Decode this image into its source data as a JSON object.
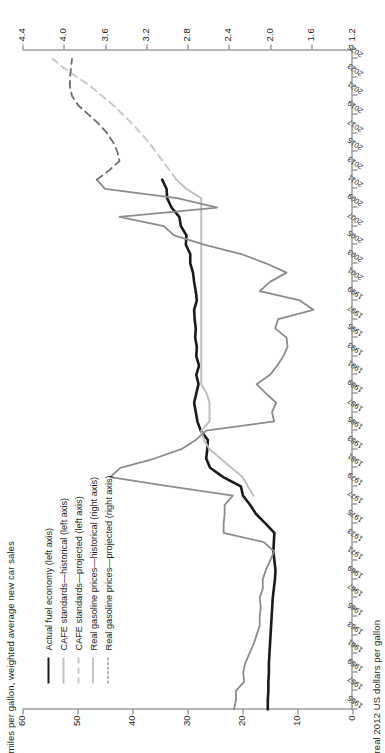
{
  "chart_data": {
    "type": "line",
    "title": "",
    "subtitle": "",
    "xlabel": "",
    "ylabel": "miles per gallon, weighted average new car sales",
    "ylabel_right": "real 2012 US dollars per gallon",
    "xlim": [
      1955,
      2026
    ],
    "ylim": [
      0,
      60
    ],
    "ylim_right": [
      1.2,
      4.4
    ],
    "grid": false,
    "legend_position": "upper-left",
    "yticks": [
      "0",
      "10",
      "20",
      "30",
      "40",
      "50",
      "60"
    ],
    "yticks_right": [
      "1.2",
      "1.6",
      "2.0",
      "2.4",
      "2.8",
      "3.2",
      "3.6",
      "4.0",
      "4.4"
    ],
    "xticks": [
      "1955",
      "1957",
      "1959",
      "1961",
      "1963",
      "1965",
      "1967",
      "1969",
      "1971",
      "1973",
      "1975",
      "1977",
      "1979",
      "1981",
      "1983",
      "1985",
      "1987",
      "1989",
      "1991",
      "1993",
      "1995",
      "1997",
      "1999",
      "2001",
      "2003",
      "2005",
      "2007",
      "2009",
      "2011",
      "2013",
      "2015",
      "2017",
      "2019",
      "2021",
      "2023",
      "2025"
    ],
    "series": [
      {
        "name": "Actual fuel economy (left axis)",
        "axis": "left",
        "style": "solid",
        "color": "#1a1a1a",
        "width": 2.6,
        "x": [
          1955,
          1956,
          1957,
          1958,
          1959,
          1960,
          1961,
          1962,
          1963,
          1964,
          1965,
          1966,
          1967,
          1968,
          1969,
          1970,
          1971,
          1972,
          1973,
          1974,
          1975,
          1976,
          1977,
          1978,
          1979,
          1980,
          1981,
          1982,
          1983,
          1984,
          1985,
          1986,
          1987,
          1988,
          1989,
          1990,
          1991,
          1992,
          1993,
          1994,
          1995,
          1996,
          1997,
          1998,
          1999,
          2000,
          2001,
          2002,
          2003,
          2004,
          2005,
          2006,
          2007,
          2008,
          2009,
          2010,
          2011,
          2012
        ],
        "y": [
          15.4,
          15.4,
          15.3,
          15.3,
          15.2,
          15.2,
          15.1,
          15.0,
          14.9,
          14.8,
          14.7,
          14.6,
          14.5,
          14.3,
          14.1,
          14.0,
          14.2,
          14.4,
          14.3,
          14.2,
          15.8,
          17.5,
          18.6,
          19.9,
          20.3,
          23.5,
          25.9,
          26.6,
          26.4,
          26.3,
          27.6,
          28.2,
          28.5,
          28.8,
          28.4,
          28.0,
          28.4,
          27.9,
          28.4,
          28.3,
          28.6,
          28.5,
          28.7,
          28.8,
          28.3,
          28.5,
          28.8,
          29.0,
          29.5,
          29.5,
          30.3,
          30.2,
          31.2,
          31.5,
          32.9,
          33.7,
          33.8,
          34.6
        ]
      },
      {
        "name": "CAFE standards—historical (left axis)",
        "axis": "left",
        "style": "solid",
        "color": "#bfbfbf",
        "width": 2.0,
        "x": [
          1978,
          1979,
          1980,
          1981,
          1982,
          1983,
          1984,
          1985,
          1986,
          1987,
          1988,
          1989,
          1990,
          1991,
          1992,
          1993,
          1994,
          1995,
          1996,
          1997,
          1998,
          1999,
          2000,
          2001,
          2002,
          2003,
          2004,
          2005,
          2006,
          2007,
          2008,
          2009,
          2010,
          2011,
          2012
        ],
        "y": [
          18.0,
          19.0,
          20.0,
          22.0,
          24.0,
          26.0,
          27.0,
          27.5,
          26.0,
          26.0,
          26.0,
          26.5,
          27.5,
          27.5,
          27.5,
          27.5,
          27.5,
          27.5,
          27.5,
          27.5,
          27.5,
          27.5,
          27.5,
          27.5,
          27.5,
          27.5,
          27.5,
          27.5,
          27.5,
          27.5,
          27.5,
          27.5,
          27.5,
          30.2,
          32.0
        ]
      },
      {
        "name": "CAFE standards—projected (left axis)",
        "axis": "left",
        "style": "dashed",
        "color": "#c9c9c9",
        "width": 2.0,
        "x": [
          2012,
          2014,
          2016,
          2018,
          2020,
          2022,
          2024,
          2025
        ],
        "y": [
          32.0,
          34.5,
          37.0,
          40.0,
          43.5,
          47.5,
          52.5,
          54.5
        ]
      },
      {
        "name": "Real gasoline prices—historical (right axis)",
        "axis": "right",
        "style": "solid",
        "color": "#8c8c8c",
        "width": 1.8,
        "x": [
          1955,
          1956,
          1957,
          1958,
          1959,
          1960,
          1961,
          1962,
          1963,
          1964,
          1965,
          1966,
          1967,
          1968,
          1969,
          1970,
          1971,
          1972,
          1973,
          1974,
          1975,
          1976,
          1977,
          1978,
          1979,
          1980,
          1981,
          1982,
          1983,
          1984,
          1985,
          1986,
          1987,
          1988,
          1989,
          1990,
          1991,
          1992,
          1993,
          1994,
          1995,
          1996,
          1997,
          1998,
          1999,
          2000,
          2001,
          2002,
          2003,
          2004,
          2005,
          2006,
          2007,
          2008,
          2009,
          2010,
          2011,
          2012
        ],
        "y": [
          2.35,
          2.33,
          2.33,
          2.25,
          2.26,
          2.24,
          2.2,
          2.16,
          2.13,
          2.1,
          2.1,
          2.09,
          2.1,
          2.07,
          2.07,
          2.04,
          2.0,
          1.96,
          2.06,
          2.45,
          2.45,
          2.44,
          2.44,
          2.36,
          2.97,
          3.55,
          3.45,
          3.12,
          2.86,
          2.72,
          2.62,
          1.96,
          1.98,
          1.94,
          2.04,
          2.13,
          2.0,
          1.93,
          1.87,
          1.83,
          1.84,
          1.95,
          1.92,
          1.58,
          1.71,
          2.1,
          2.0,
          1.84,
          2.04,
          2.28,
          2.64,
          2.93,
          3.03,
          3.46,
          2.51,
          2.9,
          3.6,
          3.68
        ]
      },
      {
        "name": "Real gasoline prices—projected (right axis)",
        "axis": "right",
        "style": "dashed",
        "color": "#6d6d6d",
        "width": 1.8,
        "x": [
          2012,
          2013,
          2014,
          2015,
          2016,
          2017,
          2018,
          2019,
          2020,
          2021,
          2022,
          2023,
          2024,
          2025
        ],
        "y": [
          3.68,
          3.56,
          3.46,
          3.48,
          3.52,
          3.58,
          3.66,
          3.76,
          3.86,
          3.92,
          3.94,
          3.94,
          3.93,
          3.92
        ]
      }
    ]
  },
  "axes": {
    "left_title": "miles per gallon, weighted average new car sales",
    "right_title": "real 2012 US dollars per gallon"
  },
  "legend": {
    "items": [
      {
        "label": "Actual fuel economy (left axis)",
        "style": "solid",
        "color": "#1a1a1a",
        "width": "2.6"
      },
      {
        "label": "CAFE standards—historical (left axis)",
        "style": "solid",
        "color": "#bfbfbf",
        "width": "2"
      },
      {
        "label": "CAFE standards—projected (left axis)",
        "style": "dashed",
        "color": "#c9c9c9",
        "width": "2"
      },
      {
        "label": "Real gasoline prices—historical (right axis)",
        "style": "solid",
        "color": "#8c8c8c",
        "width": "1.8"
      },
      {
        "label": "Real gasoline prices—projected (right axis)",
        "style": "dashed",
        "color": "#6d6d6d",
        "width": "1.8"
      }
    ]
  }
}
